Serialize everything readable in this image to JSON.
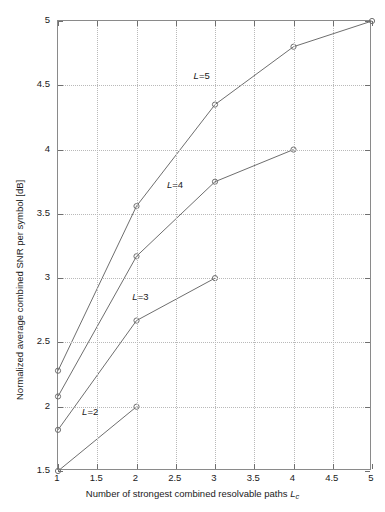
{
  "chart_data": {
    "type": "line",
    "title": "",
    "xlabel": "Number of strongest combined resolvable paths Lc",
    "xlabel_main": "Number of strongest combined resolvable paths ",
    "xlabel_var": "L",
    "xlabel_sub": "c",
    "ylabel": "Normalized average combined SNR per symbol [dB]",
    "xlim": [
      1,
      5
    ],
    "ylim": [
      1.5,
      5
    ],
    "xticks": [
      "1",
      "1.5",
      "2",
      "2.5",
      "3",
      "3.5",
      "4",
      "4.5",
      "5"
    ],
    "xtick_values": [
      1,
      1.5,
      2,
      2.5,
      3,
      3.5,
      4,
      4.5,
      5
    ],
    "yticks": [
      "1.5",
      "2",
      "2.5",
      "3",
      "3.5",
      "4",
      "4.5",
      "5"
    ],
    "ytick_values": [
      1.5,
      2,
      2.5,
      3,
      3.5,
      4,
      4.5,
      5
    ],
    "grid": true,
    "grid_style": "dotted",
    "legend_position": "inline-annotations",
    "line_color": "#6e6e6e",
    "marker": "circle-open",
    "series": [
      {
        "name": "L=2",
        "label_main": "L",
        "label_rest": "=2",
        "x": [
          1,
          2
        ],
        "values": [
          1.5,
          2.0
        ],
        "label_x": 1.32,
        "label_y": 1.94
      },
      {
        "name": "L=3",
        "label_main": "L",
        "label_rest": "=3",
        "x": [
          1,
          2,
          3
        ],
        "values": [
          1.82,
          2.67,
          3.0
        ],
        "label_x": 1.96,
        "label_y": 2.84
      },
      {
        "name": "L=4",
        "label_main": "L",
        "label_rest": "=4",
        "x": [
          1,
          2,
          3,
          4
        ],
        "values": [
          2.08,
          3.17,
          3.75,
          4.0
        ],
        "label_x": 2.4,
        "label_y": 3.71
      },
      {
        "name": "L=5",
        "label_main": "L",
        "label_rest": "=5",
        "x": [
          1,
          2,
          3,
          4,
          5
        ],
        "values": [
          2.28,
          3.56,
          4.35,
          4.8,
          5.0
        ],
        "label_x": 2.74,
        "label_y": 4.56
      }
    ]
  }
}
